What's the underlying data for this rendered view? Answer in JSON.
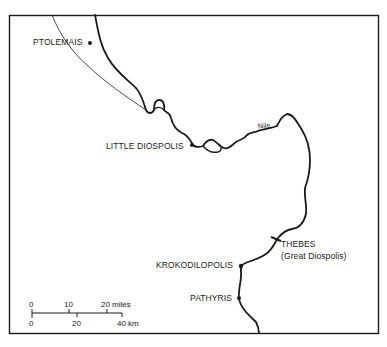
{
  "map": {
    "river": {
      "name": "Nile"
    },
    "places": [
      {
        "name": "PTOLEMAIS",
        "x": 90,
        "y": 43
      },
      {
        "name": "LITTLE DIOSPOLIS",
        "x": 192,
        "y": 145
      },
      {
        "name": "THEBES",
        "subtitle": "(Great Diospolis)",
        "x": 276,
        "y": 239
      },
      {
        "name": "KROKODILOPOLIS",
        "x": 241,
        "y": 265
      },
      {
        "name": "PATHYRIS",
        "x": 239,
        "y": 298
      }
    ],
    "scale": {
      "miles": {
        "ticks": [
          "0",
          "10",
          "20 miles"
        ]
      },
      "km": {
        "ticks": [
          "0",
          "20",
          "40 km"
        ]
      }
    },
    "colors": {
      "ink": "#1a1a1a",
      "background": "#ffffff"
    }
  }
}
